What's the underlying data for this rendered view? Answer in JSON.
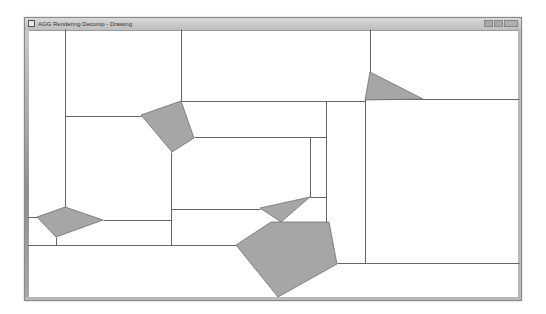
{
  "window": {
    "title": "AGG Rendering Decomp - Drawing",
    "icon": "app-icon",
    "controls": [
      "minimize",
      "maximize",
      "close"
    ]
  },
  "canvas": {
    "background": "#ffffff",
    "line_color": "#555555",
    "fill_color": "#a6a6a6",
    "polygon_stroke": "#6f6f6f",
    "bounds": {
      "left": 28,
      "top": 29,
      "right": 519,
      "bottom": 298
    },
    "polygons": [
      {
        "name": "polygon-upper-left",
        "points": [
          [
            141,
            115
          ],
          [
            181,
            101
          ],
          [
            194,
            138
          ],
          [
            172,
            152
          ]
        ]
      },
      {
        "name": "polygon-upper-right-triangle",
        "points": [
          [
            370,
            72
          ],
          [
            365,
            100
          ],
          [
            423,
            99
          ]
        ]
      },
      {
        "name": "polygon-lower-left",
        "points": [
          [
            37,
            217
          ],
          [
            65,
            207
          ],
          [
            103,
            220
          ],
          [
            56,
            237
          ]
        ]
      },
      {
        "name": "polygon-small-triangle",
        "points": [
          [
            260,
            208
          ],
          [
            310,
            197
          ],
          [
            281,
            222
          ]
        ]
      },
      {
        "name": "polygon-large-pentagon",
        "points": [
          [
            236,
            245
          ],
          [
            271,
            222
          ],
          [
            329,
            222
          ],
          [
            337,
            264
          ],
          [
            278,
            297
          ]
        ]
      }
    ],
    "lines": [
      [
        [
          65,
          29
        ],
        [
          65,
          207
        ]
      ],
      [
        [
          65,
          116
        ],
        [
          141,
          116
        ]
      ],
      [
        [
          181,
          29
        ],
        [
          181,
          101
        ]
      ],
      [
        [
          181,
          101
        ],
        [
          365,
          101
        ]
      ],
      [
        [
          370,
          29
        ],
        [
          370,
          72
        ]
      ],
      [
        [
          365,
          99
        ],
        [
          519,
          99
        ]
      ],
      [
        [
          365,
          99
        ],
        [
          365,
          263
        ]
      ],
      [
        [
          194,
          137
        ],
        [
          326,
          137
        ]
      ],
      [
        [
          326,
          101
        ],
        [
          326,
          222
        ]
      ],
      [
        [
          310,
          137
        ],
        [
          310,
          197
        ]
      ],
      [
        [
          310,
          197
        ],
        [
          326,
          197
        ]
      ],
      [
        [
          171,
          152
        ],
        [
          171,
          245
        ]
      ],
      [
        [
          171,
          209
        ],
        [
          260,
          209
        ]
      ],
      [
        [
          103,
          220
        ],
        [
          171,
          220
        ]
      ],
      [
        [
          28,
          217
        ],
        [
          37,
          217
        ]
      ],
      [
        [
          56,
          237
        ],
        [
          56,
          245
        ]
      ],
      [
        [
          28,
          245
        ],
        [
          236,
          245
        ]
      ],
      [
        [
          281,
          222
        ],
        [
          281,
          222
        ]
      ],
      [
        [
          337,
          263
        ],
        [
          519,
          263
        ]
      ]
    ]
  }
}
